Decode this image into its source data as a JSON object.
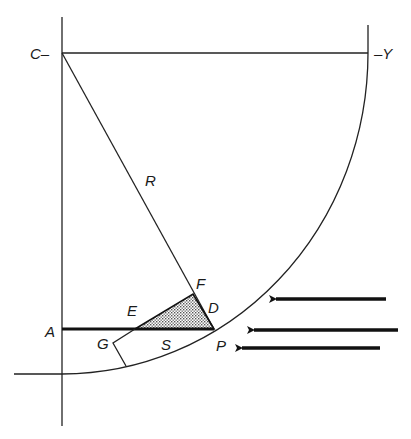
{
  "diagram": {
    "type": "geometry",
    "labels": {
      "C": "C–",
      "Y": "–Y",
      "R": "R",
      "F": "F",
      "D": "D",
      "E": "E",
      "A": "A",
      "G": "G",
      "S": "S",
      "P": "P"
    },
    "points": {
      "C": [
        62,
        53
      ],
      "Y_end": [
        368,
        53
      ],
      "A": [
        62,
        329
      ],
      "P": [
        214,
        329
      ],
      "F": [
        193,
        294
      ],
      "E": [
        135,
        329
      ],
      "G": [
        113,
        343
      ],
      "G_bottom": [
        126,
        366
      ]
    },
    "arrows": [
      {
        "from": [
          386,
          299
        ],
        "to": [
          270,
          299
        ]
      },
      {
        "from": [
          398,
          330
        ],
        "to": [
          248,
          330
        ]
      },
      {
        "from": [
          380,
          348
        ],
        "to": [
          236,
          348
        ]
      }
    ],
    "colors": {
      "line": "#222222",
      "background": "#ffffff",
      "shade": "#9a9a9a"
    }
  }
}
